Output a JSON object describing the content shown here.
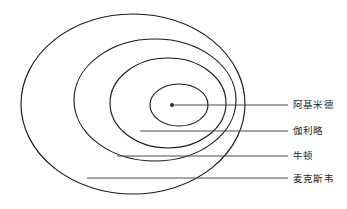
{
  "diagram": {
    "type": "nested-ellipses",
    "background_color": "#ffffff",
    "stroke_color": "#1a1a1a",
    "leader_color": "#4a4a4a",
    "text_color": "#1d1d1d",
    "center_dot": {
      "x": 172,
      "y": 105
    },
    "rings": [
      {
        "label": "阿基米德",
        "name": "archimedes",
        "cx": 179,
        "cy": 105,
        "rx": 29,
        "ry": 21,
        "label_x": 293,
        "label_y": 99,
        "leader_from_x": 172,
        "leader_to_x": 288,
        "leader_y": 105
      },
      {
        "label": "伽利略",
        "name": "galileo",
        "cx": 168,
        "cy": 103,
        "rx": 58,
        "ry": 45,
        "label_x": 293,
        "label_y": 125,
        "leader_from_x": 140,
        "leader_to_x": 288,
        "leader_y": 131
      },
      {
        "label": "牛顿",
        "name": "newton",
        "cx": 155,
        "cy": 100,
        "rx": 81,
        "ry": 61,
        "label_x": 293,
        "label_y": 150,
        "leader_from_x": 117,
        "leader_to_x": 288,
        "leader_y": 156
      },
      {
        "label": "麦克斯韦",
        "name": "maxwell",
        "cx": 133,
        "cy": 104,
        "rx": 112,
        "ry": 90,
        "label_x": 293,
        "label_y": 173,
        "leader_from_x": 87,
        "leader_to_x": 288,
        "leader_y": 178
      }
    ]
  }
}
